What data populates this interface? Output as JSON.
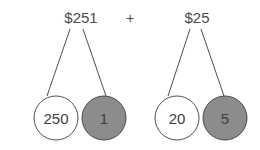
{
  "diagram": {
    "type": "number-bond-decomposition",
    "operator": "+",
    "colors": {
      "line": "#3a3a3a",
      "white_node_fill": "#ffffff",
      "shaded_node_fill": "#8c8c8c",
      "text": "#4a4a4a"
    },
    "groups": [
      {
        "total": "$251",
        "parts": [
          {
            "value": "250",
            "style": "white"
          },
          {
            "value": "1",
            "style": "shaded"
          }
        ]
      },
      {
        "total": "$25",
        "parts": [
          {
            "value": "20",
            "style": "white"
          },
          {
            "value": "5",
            "style": "shaded"
          }
        ]
      }
    ]
  }
}
